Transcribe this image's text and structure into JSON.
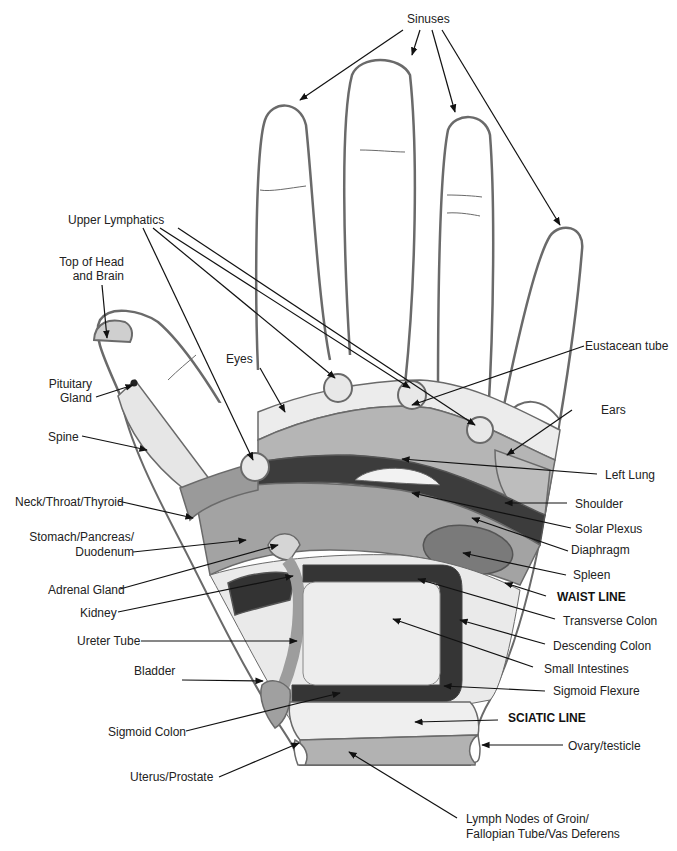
{
  "diagram": {
    "colors": {
      "outline": "#6a6a6a",
      "light_zone": "#e6e6e6",
      "mid_zone": "#a8a8a8",
      "dark_zone": "#3c3c3c",
      "medium_dark": "#7a7a7a",
      "arrow": "#111111"
    },
    "labels": {
      "sinuses": "Sinuses",
      "upper_lymphatics": "Upper Lymphatics",
      "top_of_head_1": "Top of Head",
      "top_of_head_2": "and Brain",
      "pituitary_1": "Pituitary",
      "pituitary_2": "Gland",
      "eyes": "Eyes",
      "eustacean_tube": "Eustacean tube",
      "ears": "Ears",
      "spine": "Spine",
      "left_lung": "Left Lung",
      "neck": "Neck/Throat/Thyroid",
      "shoulder": "Shoulder",
      "solar_plexus": "Solar Plexus",
      "stomach_1": "Stomach/Pancreas/",
      "stomach_2": "Duodenum",
      "diaphragm": "Diaphragm",
      "adrenal": "Adrenal Gland",
      "spleen": "Spleen",
      "kidney": "Kidney",
      "waist_line": "WAIST LINE",
      "transverse_colon": "Transverse Colon",
      "ureter": "Ureter Tube",
      "descending_colon": "Descending Colon",
      "small_intestines": "Small Intestines",
      "bladder": "Bladder",
      "sigmoid_flexure": "Sigmoid Flexure",
      "sciatic_line": "SCIATIC LINE",
      "sigmoid_colon": "Sigmoid Colon",
      "ovary": "Ovary/testicle",
      "uterus": "Uterus/Prostate",
      "lymph_1": "Lymph Nodes of Groin/",
      "lymph_2": "Fallopian Tube/Vas Deferens"
    }
  }
}
